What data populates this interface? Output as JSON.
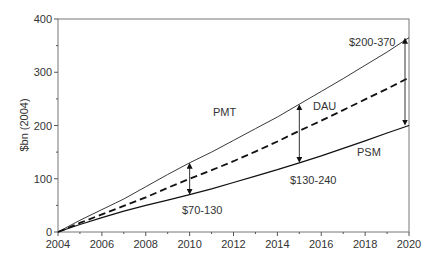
{
  "chart_data": {
    "type": "line",
    "title": "",
    "xlabel": "",
    "ylabel": "$bn (2004)",
    "xlim": [
      2004,
      2020
    ],
    "ylim": [
      0,
      400
    ],
    "x_ticks": [
      2004,
      2006,
      2008,
      2010,
      2012,
      2014,
      2016,
      2018,
      2020
    ],
    "y_ticks": [
      0,
      100,
      200,
      300,
      400
    ],
    "grid": false,
    "legend": "none (inline labels)",
    "x": [
      2004,
      2005,
      2006,
      2007,
      2008,
      2009,
      2010,
      2011,
      2012,
      2013,
      2014,
      2015,
      2016,
      2017,
      2018,
      2019,
      2020
    ],
    "series": [
      {
        "name": "PMT",
        "style": "thin solid",
        "values": [
          0,
          22,
          42,
          62,
          85,
          108,
          130,
          150,
          172,
          194,
          216,
          240,
          264,
          288,
          313,
          338,
          365
        ]
      },
      {
        "name": "DAU",
        "style": "dashed",
        "values": [
          0,
          17,
          33,
          49,
          65,
          83,
          100,
          116,
          133,
          151,
          170,
          190,
          209,
          229,
          249,
          269,
          290
        ]
      },
      {
        "name": "PSM",
        "style": "solid",
        "values": [
          0,
          14,
          27,
          39,
          50,
          60,
          70,
          81,
          93,
          105,
          117,
          130,
          143,
          157,
          171,
          186,
          200
        ]
      }
    ],
    "annotations": [
      {
        "text": "$70-130",
        "x": 2010,
        "range": [
          70,
          130
        ]
      },
      {
        "text": "$130-240",
        "x": 2015,
        "range": [
          130,
          240
        ]
      },
      {
        "text": "$200-370",
        "x": 2020,
        "range": [
          200,
          365
        ]
      }
    ]
  },
  "labels": {
    "ylabel": "$bn (2004)",
    "pmt": "PMT",
    "dau": "DAU",
    "psm": "PSM",
    "ann_2010": "$70-130",
    "ann_2015": "$130-240",
    "ann_2020": "$200-370"
  }
}
